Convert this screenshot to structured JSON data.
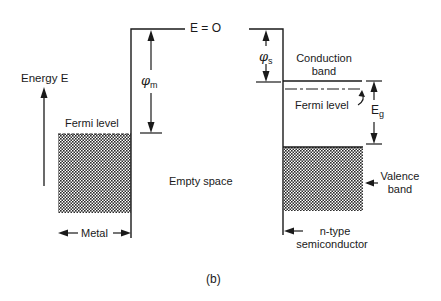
{
  "figure": {
    "caption": "(b)",
    "labels": {
      "energy_axis": "Energy E",
      "vacuum_level": "E = O",
      "metal_fermi_level": "Fermi level",
      "metal_work_function_symbol": "φ",
      "metal_work_function_subscript": "m",
      "semiconductor_work_function_symbol": "φ",
      "semiconductor_work_function_subscript": "s",
      "conduction_band_line1": "Conduction",
      "conduction_band_line2": "band",
      "semiconductor_fermi_level": "Fermi level",
      "band_gap_symbol": "E",
      "band_gap_subscript": "g",
      "empty_space": "Empty space",
      "valence_band_line1": "Valence",
      "valence_band_line2": "band",
      "metal": "Metal",
      "semiconductor_line1": "n-type",
      "semiconductor_line2": "semiconductor"
    },
    "colors": {
      "line": "#1a1a1a",
      "hatch_dark": "#2a2a2a",
      "hatch_light": "#ffffff",
      "background": "#ffffff"
    }
  }
}
